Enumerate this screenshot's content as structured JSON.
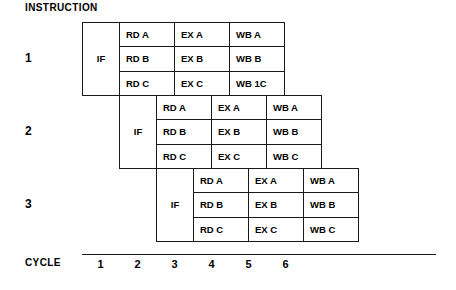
{
  "heading": "INSTRUCTION",
  "axis": {
    "label": "CYCLE",
    "ticks": [
      "1",
      "2",
      "3",
      "4",
      "5",
      "6"
    ]
  },
  "blocks": [
    {
      "number": "1",
      "if_label": "IF",
      "start_cycle": 1,
      "rows": [
        [
          "RD A",
          "EX A",
          "WB A"
        ],
        [
          "RD B",
          "EX B",
          "WB B"
        ],
        [
          "RD C",
          "EX C",
          "WB 1C"
        ]
      ]
    },
    {
      "number": "2",
      "if_label": "IF",
      "start_cycle": 2,
      "rows": [
        [
          "RD A",
          "EX A",
          "WB A"
        ],
        [
          "RD B",
          "EX B",
          "WB B"
        ],
        [
          "RD C",
          "EX C",
          "WB C"
        ]
      ]
    },
    {
      "number": "3",
      "if_label": "IF",
      "start_cycle": 3,
      "rows": [
        [
          "RD A",
          "EX A",
          "WB A"
        ],
        [
          "RD B",
          "EX B",
          "WB B"
        ],
        [
          "RD C",
          "EX C",
          "WB C"
        ]
      ]
    }
  ]
}
